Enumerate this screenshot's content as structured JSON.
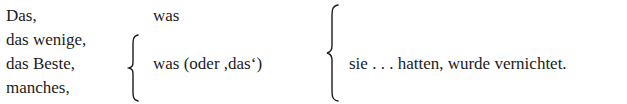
{
  "subjects": [
    {
      "label": "Das,"
    },
    {
      "label": "das wenige,"
    },
    {
      "label": "das Beste,"
    },
    {
      "label": "manches,"
    }
  ],
  "relatives": {
    "first": "was",
    "second": "was (oder ,das‘)"
  },
  "predicate": "sie . . . hatten, wurde vernichtet."
}
